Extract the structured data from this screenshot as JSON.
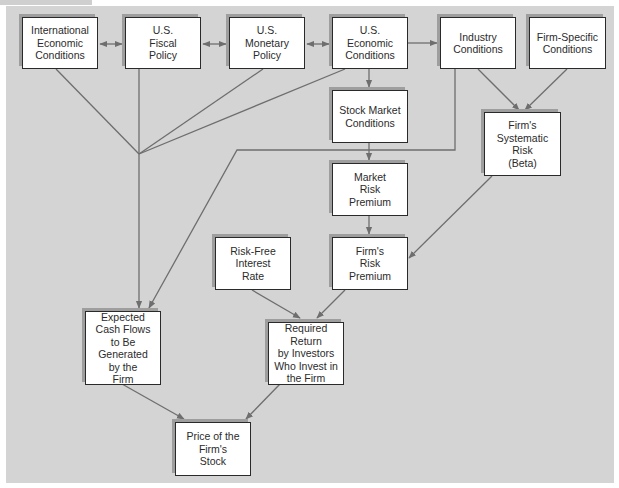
{
  "diagram": {
    "type": "flowchart",
    "background_color": "#d4d4d4",
    "node_fill": "#ffffff",
    "edge_color": "#6e6e6e",
    "nodes": [
      {
        "id": "intl",
        "label": "International\nEconomic\nConditions"
      },
      {
        "id": "fiscal",
        "label": "U.S.\nFiscal\nPolicy"
      },
      {
        "id": "monetary",
        "label": "U.S.\nMonetary\nPolicy"
      },
      {
        "id": "useconomic",
        "label": "U.S.\nEconomic\nConditions"
      },
      {
        "id": "industry",
        "label": "Industry\nConditions"
      },
      {
        "id": "firmspecific",
        "label": "Firm-Specific\nConditions"
      },
      {
        "id": "stockmarket",
        "label": "Stock Market\nConditions"
      },
      {
        "id": "beta",
        "label": "Firm's\nSystematic\nRisk\n(Beta)"
      },
      {
        "id": "mrp",
        "label": "Market\nRisk\nPremium"
      },
      {
        "id": "riskfree",
        "label": "Risk-Free\nInterest\nRate"
      },
      {
        "id": "firmrp",
        "label": "Firm's\nRisk\nPremium"
      },
      {
        "id": "cashflows",
        "label": "Expected\nCash Flows\nto Be\nGenerated\nby the\nFirm"
      },
      {
        "id": "reqreturn",
        "label": "Required Return\nby Investors\nWho Invest in\nthe Firm"
      },
      {
        "id": "price",
        "label": "Price of the\nFirm's\nStock"
      }
    ],
    "edges": [
      {
        "from": "intl",
        "to": "fiscal",
        "type": "bidirectional"
      },
      {
        "from": "fiscal",
        "to": "monetary",
        "type": "bidirectional"
      },
      {
        "from": "monetary",
        "to": "useconomic",
        "type": "bidirectional"
      },
      {
        "from": "useconomic",
        "to": "industry",
        "type": "directed"
      },
      {
        "from": "useconomic",
        "to": "stockmarket",
        "type": "directed"
      },
      {
        "from": "intl",
        "to": "cashflows",
        "type": "directed",
        "via": "merge-hub"
      },
      {
        "from": "fiscal",
        "to": "cashflows",
        "type": "directed",
        "via": "merge-hub"
      },
      {
        "from": "monetary",
        "to": "cashflows",
        "type": "directed",
        "via": "merge-hub"
      },
      {
        "from": "useconomic",
        "to": "cashflows",
        "type": "directed",
        "via": "merge-hub"
      },
      {
        "from": "industry",
        "to": "cashflows",
        "type": "directed"
      },
      {
        "from": "industry",
        "to": "beta",
        "type": "directed"
      },
      {
        "from": "firmspecific",
        "to": "beta",
        "type": "directed"
      },
      {
        "from": "stockmarket",
        "to": "mrp",
        "type": "directed"
      },
      {
        "from": "mrp",
        "to": "firmrp",
        "type": "directed"
      },
      {
        "from": "beta",
        "to": "firmrp",
        "type": "directed"
      },
      {
        "from": "riskfree",
        "to": "reqreturn",
        "type": "directed"
      },
      {
        "from": "firmrp",
        "to": "reqreturn",
        "type": "directed"
      },
      {
        "from": "cashflows",
        "to": "price",
        "type": "directed"
      },
      {
        "from": "reqreturn",
        "to": "price",
        "type": "directed"
      }
    ]
  }
}
